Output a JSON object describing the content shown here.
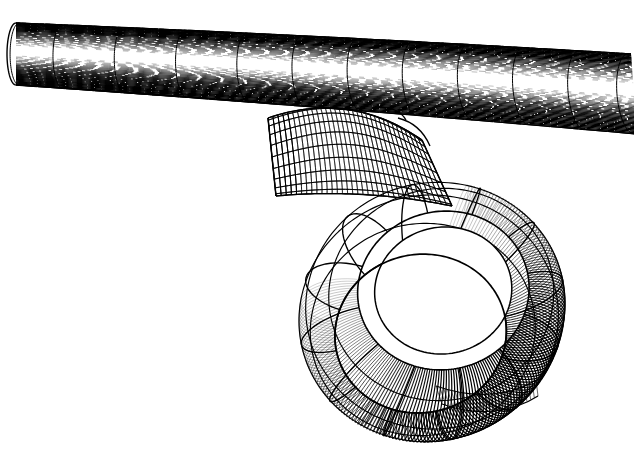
{
  "document": {
    "kind": "technical-line-art-illustration",
    "title": "",
    "caption": "",
    "background_color": "#ffffff",
    "ink_color": "#000000",
    "width": 634,
    "height": 449,
    "render_style": "hatched-wireframe",
    "visible_text": []
  },
  "scene": {
    "description": "Line-art rendering of a cylindrical tube with a ring (torus) attached beneath it by a smooth fillet blend surface",
    "objects": [
      {
        "id": "cylinder",
        "name": "horizontal-tube",
        "shape": "cylinder",
        "hatch_direction": "axial",
        "hatch_spacing": 3.0,
        "isoline_count": 11,
        "axis_start": [
          16,
          54
        ],
        "axis_end": [
          634,
          88
        ],
        "radius_px": 31,
        "silhouette_top": [
          [
            16,
            22
          ],
          [
            634,
            50
          ]
        ],
        "silhouette_bottom": [
          [
            16,
            84
          ],
          [
            634,
            126
          ]
        ],
        "rim_left_ellipse_rx": 9,
        "rim_left_ellipse_ry": 31
      },
      {
        "id": "blend",
        "name": "fillet-blend-saddle",
        "shape": "blend-surface",
        "hatch_direction": "cross-mesh",
        "u_lines": 14,
        "v_lines": 9,
        "bbox": [
          262,
          100,
          200,
          110
        ]
      },
      {
        "id": "ring",
        "name": "hanging-ring-torus",
        "shape": "torus",
        "hatch_direction": "meridional",
        "center": [
          432,
          312
        ],
        "outer_radius_x": 128,
        "outer_radius_y": 128,
        "tube_radius_px": 46,
        "facet_count": 12,
        "band_count": 5,
        "hole_center": [
          438,
          310
        ],
        "hole_radius_x": 47,
        "hole_radius_y": 56,
        "tilt_deg": -14
      }
    ]
  },
  "chart_data": {
    "type": "line",
    "title": "",
    "xlabel": "",
    "ylabel": "",
    "grid": false,
    "legend": null,
    "series": [
      {
        "name": "cylinder-axial-hatching",
        "kind": "hatch",
        "count": 42,
        "stroke": "#000000",
        "stroke_width": 1.0
      },
      {
        "name": "cylinder-cross-sections",
        "kind": "isoline",
        "count": 11,
        "stroke": "#000000",
        "stroke_width": 1.1
      },
      {
        "name": "blend-mesh-u",
        "kind": "isoline",
        "count": 14,
        "stroke": "#000000",
        "stroke_width": 1.0
      },
      {
        "name": "blend-mesh-v",
        "kind": "isoline",
        "count": 9,
        "stroke": "#000000",
        "stroke_width": 1.0
      },
      {
        "name": "ring-meridional-hatching",
        "kind": "hatch",
        "count": 240,
        "stroke": "#000000",
        "stroke_width": 0.9
      },
      {
        "name": "ring-facet-boundaries",
        "kind": "isoline",
        "count": 12,
        "stroke": "#000000",
        "stroke_width": 1.3
      },
      {
        "name": "ring-band-rings",
        "kind": "isoline",
        "count": 5,
        "stroke": "#000000",
        "stroke_width": 1.3
      }
    ]
  },
  "palette": {
    "ink": "#000000",
    "paper": "#ffffff",
    "shadow_tone": "#1a1a1a",
    "highlight_tone": "#ffffff"
  }
}
